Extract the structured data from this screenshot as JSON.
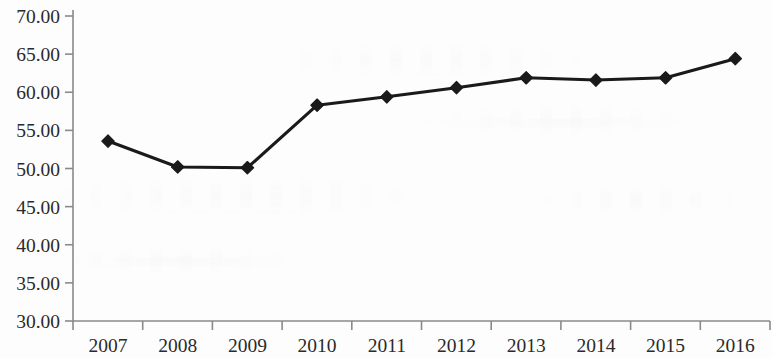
{
  "chart_data": {
    "type": "line",
    "title": "",
    "subtitle": "",
    "xlabel": "",
    "ylabel": "",
    "categories": [
      "2007",
      "2008",
      "2009",
      "2010",
      "2011",
      "2012",
      "2013",
      "2014",
      "2015",
      "2016"
    ],
    "values": [
      53.6,
      50.2,
      50.1,
      58.3,
      59.4,
      60.6,
      61.9,
      61.6,
      61.9,
      64.4
    ],
    "series": [
      {
        "name": "",
        "values": [
          53.6,
          50.2,
          50.1,
          58.3,
          59.4,
          60.6,
          61.9,
          61.6,
          61.9,
          64.4
        ]
      }
    ],
    "ylim": [
      30.0,
      70.0
    ],
    "ytick_step": 5.0,
    "ytick_labels": [
      "30.00",
      "35.00",
      "40.00",
      "45.00",
      "50.00",
      "55.00",
      "60.00",
      "65.00",
      "70.00"
    ],
    "ytick_values": [
      30.0,
      35.0,
      40.0,
      45.0,
      50.0,
      55.0,
      60.0,
      65.0,
      70.0
    ],
    "xtick_labels": [
      "2007",
      "2008",
      "2009",
      "2010",
      "2011",
      "2012",
      "2013",
      "2014",
      "2015",
      "2016"
    ],
    "grid": false,
    "legend": null,
    "legend_position": "none",
    "annotations": [],
    "marker": "diamond",
    "line_color": "#1a1a1a",
    "marker_color": "#1a1a1a",
    "axis_color": "#8a8a8a",
    "tick_label_color": "#2a2a2a",
    "background_color": "#fdfdfd"
  }
}
